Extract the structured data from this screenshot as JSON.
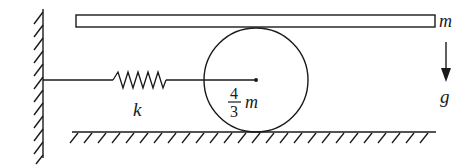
{
  "diagram": {
    "labels": {
      "plank_mass": "m",
      "spring_constant": "k",
      "cylinder_mass_num": "4",
      "cylinder_mass_den": "3",
      "cylinder_mass_sym": "m",
      "gravity": "g"
    },
    "colors": {
      "stroke": "#1a1a1a",
      "background": "#ffffff"
    }
  }
}
